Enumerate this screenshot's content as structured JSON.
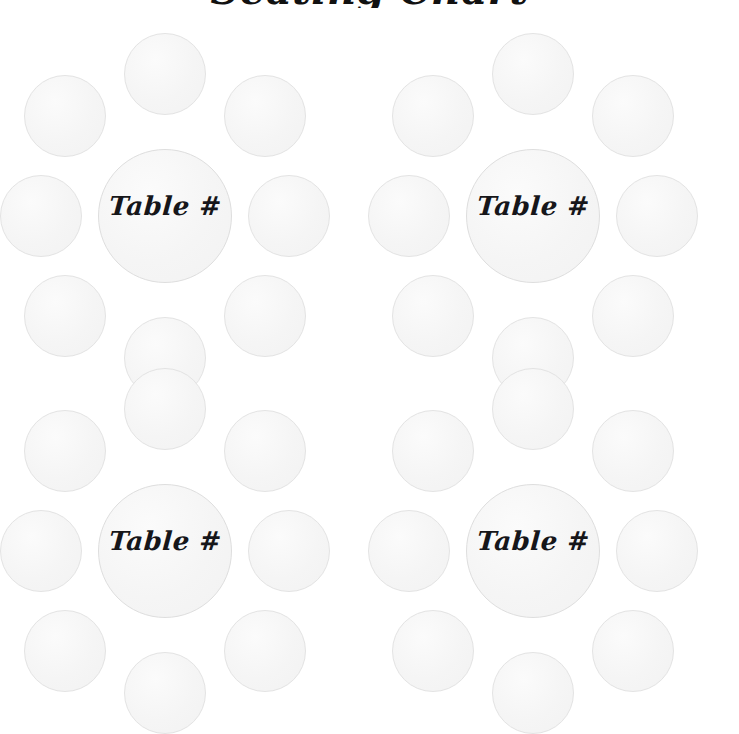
{
  "page": {
    "title": "Seating Chart",
    "background_color": "#ffffff",
    "width": 739,
    "height": 692
  },
  "style": {
    "circle_fill": "#f4f4f4",
    "circle_border": "#e3e3e3",
    "label_color": "#16161a"
  },
  "tables": [
    {
      "id": "table-group-1",
      "label": "Table #",
      "seat_count": 8,
      "seats": [
        {
          "position": "north",
          "label": ""
        },
        {
          "position": "northeast",
          "label": ""
        },
        {
          "position": "east",
          "label": ""
        },
        {
          "position": "southeast",
          "label": ""
        },
        {
          "position": "south",
          "label": ""
        },
        {
          "position": "southwest",
          "label": ""
        },
        {
          "position": "west",
          "label": ""
        },
        {
          "position": "northwest",
          "label": ""
        }
      ]
    },
    {
      "id": "table-group-2",
      "label": "Table #",
      "seat_count": 8,
      "seats": [
        {
          "position": "north",
          "label": ""
        },
        {
          "position": "northeast",
          "label": ""
        },
        {
          "position": "east",
          "label": ""
        },
        {
          "position": "southeast",
          "label": ""
        },
        {
          "position": "south",
          "label": ""
        },
        {
          "position": "southwest",
          "label": ""
        },
        {
          "position": "west",
          "label": ""
        },
        {
          "position": "northwest",
          "label": ""
        }
      ]
    },
    {
      "id": "table-group-3",
      "label": "Table #",
      "seat_count": 8,
      "seats": [
        {
          "position": "north",
          "label": ""
        },
        {
          "position": "northeast",
          "label": ""
        },
        {
          "position": "east",
          "label": ""
        },
        {
          "position": "southeast",
          "label": ""
        },
        {
          "position": "south",
          "label": ""
        },
        {
          "position": "southwest",
          "label": ""
        },
        {
          "position": "west",
          "label": ""
        },
        {
          "position": "northwest",
          "label": ""
        }
      ]
    },
    {
      "id": "table-group-4",
      "label": "Table #",
      "seat_count": 8,
      "seats": [
        {
          "position": "north",
          "label": ""
        },
        {
          "position": "northeast",
          "label": ""
        },
        {
          "position": "east",
          "label": ""
        },
        {
          "position": "southeast",
          "label": ""
        },
        {
          "position": "south",
          "label": ""
        },
        {
          "position": "southwest",
          "label": ""
        },
        {
          "position": "west",
          "label": ""
        },
        {
          "position": "northwest",
          "label": ""
        }
      ]
    }
  ]
}
